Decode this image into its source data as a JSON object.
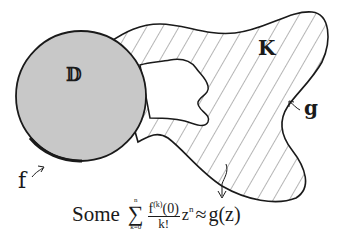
{
  "diagram": {
    "disk_label": "𝔻",
    "compact_set_label": "K",
    "function_f_label": "f",
    "function_g_label": "g",
    "colors": {
      "disk_fill": "#c8c8c8",
      "outline": "#1a1a1a",
      "hatch": "#5a5a5a",
      "background": "#ffffff"
    }
  },
  "formula": {
    "prefix": "Some",
    "sum_upper": "n",
    "sum_lower": "k=0",
    "sum_symbol": "∑",
    "numerator_base": "f",
    "numerator_sup": "(k)",
    "numerator_arg": "(0)",
    "denominator": "k!",
    "power_base": "z",
    "power_exp": "n",
    "approx": "≈",
    "rhs": "g(z)"
  }
}
